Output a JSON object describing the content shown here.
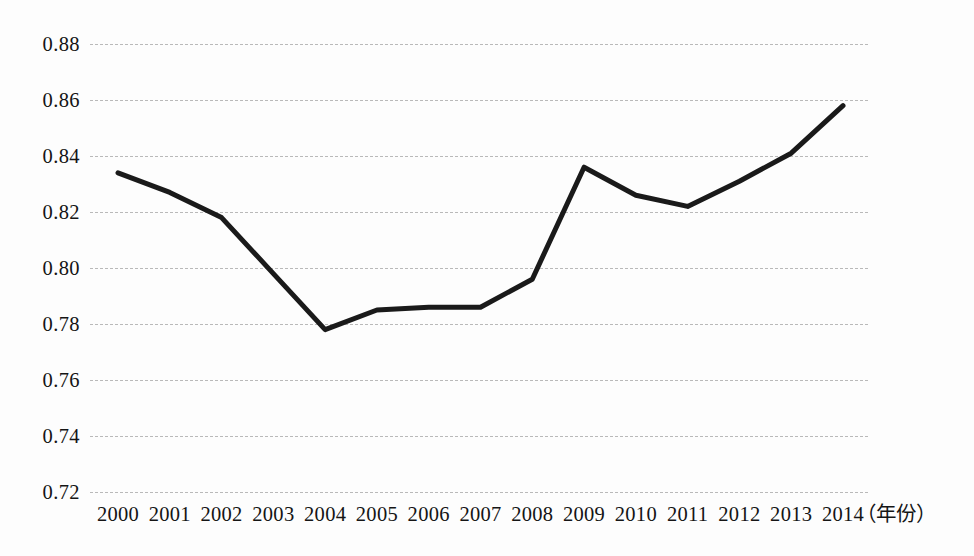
{
  "chart_data": {
    "type": "line",
    "title": "",
    "subtitle": "",
    "xlabel": "（年份）",
    "ylabel": "",
    "categories": [
      "2000",
      "2001",
      "2002",
      "2003",
      "2004",
      "2005",
      "2006",
      "2007",
      "2008",
      "2009",
      "2010",
      "2011",
      "2012",
      "2013",
      "2014"
    ],
    "values": [
      0.834,
      0.827,
      0.818,
      0.798,
      0.778,
      0.785,
      0.786,
      0.786,
      0.796,
      0.836,
      0.826,
      0.822,
      0.831,
      0.841,
      0.858
    ],
    "series": [
      {
        "name": "",
        "values": [
          0.834,
          0.827,
          0.818,
          0.798,
          0.778,
          0.785,
          0.786,
          0.786,
          0.796,
          0.836,
          0.826,
          0.822,
          0.831,
          0.841,
          0.858
        ]
      }
    ],
    "ylim": [
      0.72,
      0.88
    ],
    "ytick_step": 0.02,
    "yticks": [
      "0.88",
      "0.86",
      "0.84",
      "0.82",
      "0.80",
      "0.78",
      "0.76",
      "0.74",
      "0.72"
    ],
    "ytick_values": [
      0.88,
      0.86,
      0.84,
      0.82,
      0.8,
      0.78,
      0.76,
      0.74,
      0.72
    ],
    "xticks": [
      "2000",
      "2001",
      "2002",
      "2003",
      "2004",
      "2005",
      "2006",
      "2007",
      "2008",
      "2009",
      "2010",
      "2011",
      "2012",
      "2013",
      "2014"
    ],
    "grid": "horizontal-dashed",
    "legend": "none",
    "line_color": "#1a1a1a",
    "line_width": 5,
    "markers": "none",
    "background_color": "#fdfdfd",
    "gridline_color": "#b9b9b9"
  }
}
